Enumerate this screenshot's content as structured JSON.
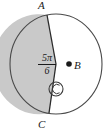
{
  "figure": {
    "type": "circle-sector-diagram",
    "labels": {
      "point_a": "A",
      "point_b": "B",
      "point_c": "C"
    },
    "angle": {
      "numerator": "5π",
      "denominator": "6",
      "value_text": "5π/6"
    },
    "colors": {
      "shaded_fill": "#c9c9c9",
      "outline": "#4a4a4a",
      "chord_line": "#2b2b2b",
      "background": "#ffffff",
      "label_text": "#1a1a1a"
    },
    "geometry": {
      "center_x": 56,
      "center_y": 64,
      "radius_x": 46,
      "radius_y": 50,
      "point_a_x": 47,
      "point_a_y": 15,
      "point_c_x": 49,
      "point_c_y": 113,
      "angle_arc_marker_x": 56,
      "angle_arc_marker_y": 89,
      "angle_arc_marker_r": 7
    }
  }
}
